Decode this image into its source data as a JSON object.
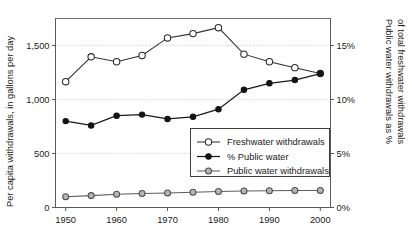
{
  "chart_data": {
    "type": "line",
    "title": "",
    "xlabel": "",
    "ylabel": "Per capita withdrawals, in gallons per day",
    "y2label": "Public water withdrawals as % of total freshwater withdrawals",
    "x": [
      1950,
      1955,
      1960,
      1965,
      1970,
      1975,
      1980,
      1985,
      1990,
      1995,
      2000
    ],
    "xlim": [
      1948,
      2002
    ],
    "ylim": [
      0,
      1750
    ],
    "y2lim": [
      0,
      17.5
    ],
    "xticks": [
      1950,
      1960,
      1970,
      1980,
      1990,
      2000
    ],
    "xticklabels": [
      "1950",
      "1960",
      "1970",
      "1980",
      "1990",
      "2000"
    ],
    "yticks": [
      0,
      500,
      1000,
      1500
    ],
    "yticklabels": [
      "0",
      "500",
      "1,000",
      "1,500"
    ],
    "y2ticks": [
      0,
      5,
      10,
      15
    ],
    "y2ticklabels": [
      "0%",
      "5%",
      "10%",
      "15%"
    ],
    "grid": true,
    "legend_position": "lower-right-inside",
    "series": [
      {
        "name": "Freshwater withdrawals",
        "axis": "left",
        "marker": "open-circle",
        "color": "#2b2b2b",
        "values": [
          1165,
          1395,
          1350,
          1408,
          1570,
          1610,
          1665,
          1420,
          1350,
          1295,
          1240
        ]
      },
      {
        "name": "% Public water",
        "axis": "right",
        "marker": "filled-circle",
        "color": "#141414",
        "values": [
          8.0,
          7.6,
          8.5,
          8.6,
          8.2,
          8.4,
          9.1,
          10.9,
          11.5,
          11.8,
          12.4
        ]
      },
      {
        "name": "Public water withdrawals",
        "axis": "left",
        "marker": "grey-circle",
        "color": "#5d5d5d",
        "values": [
          100,
          110,
          123,
          130,
          135,
          142,
          148,
          152,
          155,
          157,
          158
        ]
      }
    ]
  },
  "legend": {
    "entries": [
      {
        "label": "Freshwater withdrawals",
        "marker": "open-circle"
      },
      {
        "label": "% Public water",
        "marker": "filled-circle"
      },
      {
        "label": "Public water withdrawals",
        "marker": "grey-circle"
      }
    ]
  },
  "axes": {
    "left_title": "Per capita withdrawals, in gallons per day",
    "right_title_line1": "Public water withdrawals as %",
    "right_title_line2": "of total freshwater withdrawals"
  }
}
